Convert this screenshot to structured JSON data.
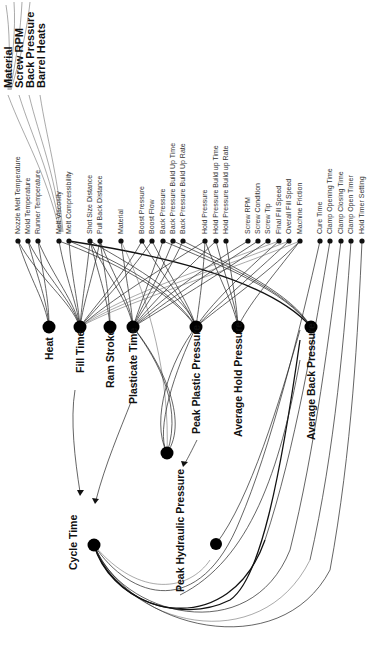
{
  "diagram": {
    "type": "cause-effect network (rotated 90°)",
    "top_labels": [
      "Material",
      "Screw RPM",
      "Back Pressure",
      "Barrel Heats"
    ],
    "input_groups": [
      {
        "group": "heat",
        "items": [
          "Nozzle Melt Temperature",
          "Mold Temperature",
          "Runner Temperature"
        ]
      },
      {
        "group": "melt",
        "items": [
          "Melt Viscosity",
          "Melt Compressibility"
        ]
      },
      {
        "group": "stroke",
        "items": [
          "Shot Size Distance",
          "Pull Back Distance"
        ]
      },
      {
        "group": "material",
        "items": [
          "Material"
        ]
      },
      {
        "group": "boost",
        "items": [
          "Boost Pressure",
          "Boost Flow",
          "Back Pressure",
          "Back Pressure Build Up Time",
          "Back Pressure Build Up Rate"
        ]
      },
      {
        "group": "hold",
        "items": [
          "Hold Pressure",
          "Hold Pressure Build up Time",
          "Hold Pressure Build up Rate"
        ]
      },
      {
        "group": "screw",
        "items": [
          "Screw RPM",
          "Screw Condition",
          "Screw Tip",
          "Final Fill Speed",
          "Overall Fill Speed",
          "Machine Friction"
        ]
      },
      {
        "group": "timers",
        "items": [
          "Cure Time",
          "Clamp Opening Time",
          "Clamp Closing Time",
          "Clamp Open Timer",
          "Hold Timer Setting"
        ]
      }
    ],
    "intermediate_nodes": [
      "Heat",
      "Fill Time",
      "Ram Stroke",
      "Plasticate Time",
      "Peak Plastic Pressure",
      "Average Hold Pressure",
      "Average Back Pressure"
    ],
    "output_nodes": [
      "Peak Hydraulic Pressure",
      "Cycle Time"
    ]
  }
}
